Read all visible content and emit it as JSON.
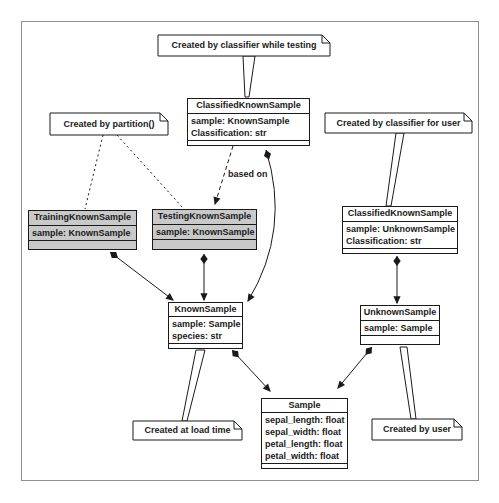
{
  "diagram": {
    "edge_label_based_on": "based on"
  },
  "classes": [
    {
      "id": "classified-known-sample-testing",
      "name": "ClassifiedKnownSample",
      "attributes": [
        "sample: KnownSample",
        "Classification: str"
      ]
    },
    {
      "id": "classified-known-sample-user",
      "name": "ClassifiedKnownSample",
      "attributes": [
        "sample: UnknownSample",
        "Classification: str"
      ]
    },
    {
      "id": "training-known-sample",
      "name": "TrainingKnownSample",
      "attributes": [
        "sample: KnownSample"
      ]
    },
    {
      "id": "testing-known-sample",
      "name": "TestingKnownSample",
      "attributes": [
        "sample: KnownSample"
      ]
    },
    {
      "id": "known-sample",
      "name": "KnownSample",
      "attributes": [
        "sample: Sample",
        "species: str"
      ]
    },
    {
      "id": "unknown-sample",
      "name": "UnknownSample",
      "attributes": [
        "sample: Sample"
      ]
    },
    {
      "id": "sample",
      "name": "Sample",
      "attributes": [
        "sepal_length: float",
        "sepal_width: float",
        "petal_length: float",
        "petal_width: float"
      ]
    }
  ],
  "notes": [
    {
      "id": "note-classifier-testing",
      "text": "Created by classifier while testing"
    },
    {
      "id": "note-partition",
      "text": "Created by partition()"
    },
    {
      "id": "note-classifier-user",
      "text": "Created by classifier for user"
    },
    {
      "id": "note-load-time",
      "text": "Created at load time"
    },
    {
      "id": "note-user",
      "text": "Created by user"
    }
  ],
  "colors": {
    "shaded_fill": "#c9c9c9",
    "stroke": "#1a1a1a",
    "frame": "#8f8f8f",
    "background": "#ffffff"
  }
}
